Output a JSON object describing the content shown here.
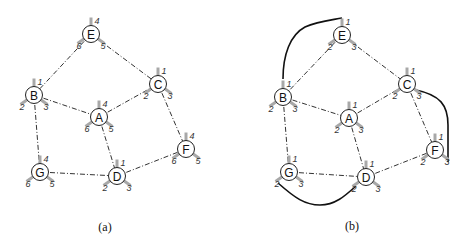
{
  "panels": [
    {
      "caption": "(a)",
      "caption_pos": [
        105,
        227
      ],
      "nodes": [
        {
          "id": "E",
          "x": 91,
          "y": 34,
          "ports": [
            "4",
            "6",
            "5"
          ]
        },
        {
          "id": "B",
          "x": 34,
          "y": 95,
          "ports": [
            "1",
            "2",
            "3"
          ]
        },
        {
          "id": "C",
          "x": 158,
          "y": 84,
          "ports": [
            "1",
            "2",
            "3"
          ]
        },
        {
          "id": "A",
          "x": 99,
          "y": 117,
          "ports": [
            "4",
            "6",
            "5"
          ]
        },
        {
          "id": "G",
          "x": 40,
          "y": 172,
          "ports": [
            "4",
            "6",
            "5"
          ]
        },
        {
          "id": "D",
          "x": 117,
          "y": 176,
          "ports": [
            "1",
            "2",
            "3"
          ]
        },
        {
          "id": "F",
          "x": 186,
          "y": 149,
          "ports": [
            "4",
            "6",
            "5"
          ]
        }
      ],
      "edges": [
        [
          "E",
          "B"
        ],
        [
          "E",
          "C"
        ],
        [
          "B",
          "A"
        ],
        [
          "A",
          "C"
        ],
        [
          "B",
          "G"
        ],
        [
          "A",
          "D"
        ],
        [
          "C",
          "F"
        ],
        [
          "G",
          "D"
        ],
        [
          "D",
          "F"
        ]
      ],
      "wires": []
    },
    {
      "caption": "(b)",
      "caption_pos": [
        352,
        226
      ],
      "nodes": [
        {
          "id": "E",
          "x": 342,
          "y": 35,
          "ports": [
            "1",
            "2",
            "3"
          ]
        },
        {
          "id": "B",
          "x": 283,
          "y": 97,
          "ports": [
            "1",
            "2",
            "3"
          ]
        },
        {
          "id": "C",
          "x": 407,
          "y": 84,
          "ports": [
            "1",
            "2",
            "3"
          ]
        },
        {
          "id": "A",
          "x": 349,
          "y": 118,
          "ports": [
            "1",
            "2",
            "3"
          ]
        },
        {
          "id": "G",
          "x": 289,
          "y": 172,
          "ports": [
            "1",
            "2",
            "3"
          ]
        },
        {
          "id": "D",
          "x": 366,
          "y": 177,
          "ports": [
            "1",
            "2",
            "3"
          ]
        },
        {
          "id": "F",
          "x": 435,
          "y": 150,
          "ports": [
            "1",
            "2",
            "3"
          ]
        }
      ],
      "edges": [
        [
          "E",
          "B"
        ],
        [
          "E",
          "C"
        ],
        [
          "B",
          "A"
        ],
        [
          "A",
          "C"
        ],
        [
          "B",
          "G"
        ],
        [
          "A",
          "D"
        ],
        [
          "C",
          "F"
        ],
        [
          "G",
          "D"
        ],
        [
          "D",
          "F"
        ]
      ],
      "wires": [
        {
          "from": "B.1",
          "to": "E.1",
          "path": "M283,79 C283,55 290,35 305,27 C318,21 332,20 342,18"
        },
        {
          "from": "C.3",
          "to": "F.3",
          "path": "M416,90 C440,95 448,105 448,125 L448,162"
        },
        {
          "from": "G.2",
          "to": "D.2",
          "path": "M278,183 C295,198 305,205 320,205 C335,205 345,196 356,186"
        }
      ]
    }
  ]
}
